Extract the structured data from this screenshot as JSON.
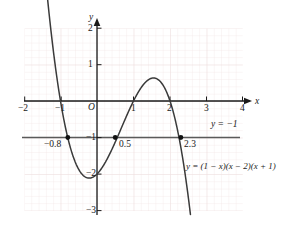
{
  "figure": {
    "title": "",
    "background_color": "#ffffff",
    "curve_color": "#333333",
    "axis_color": "#1a1a1a",
    "grid_color": "#f2e6e6",
    "point_color": "#000000"
  },
  "axes": {
    "x_axis_name": "x",
    "y_axis_name": "y",
    "origin_label": "O",
    "x_ticks": [
      "−2",
      "−1",
      "1",
      "2",
      "3",
      "4"
    ],
    "y_ticks": [
      "2",
      "1",
      "−1",
      "−2",
      "−3"
    ]
  },
  "annotations": {
    "line_label": "y = −1",
    "curve_label": "y = (1 − x)(x − 2)(x + 1)",
    "root_left": "−0.8",
    "root_mid": "0.5",
    "root_right": "2.3"
  },
  "chart_data": {
    "type": "line",
    "title": "",
    "xlabel": "x",
    "ylabel": "y",
    "xlim": [
      -2.2,
      4.25
    ],
    "ylim": [
      -3.25,
      2.25
    ],
    "grid": true,
    "grid_step": 0.2,
    "xticks": [
      -2,
      -1,
      1,
      2,
      3,
      4
    ],
    "yticks": [
      2,
      1,
      -1,
      -2,
      -3
    ],
    "series": [
      {
        "name": "y = (1 - x)(x - 2)(x + 1)",
        "type": "cubic",
        "equation": "y = (1 - x)(x - 2)(x + 1)",
        "expanded": "y = -x^3 + 2x^2 + x - 2",
        "domain": [
          -1.56,
          2.56
        ],
        "roots": [
          -1,
          1,
          2
        ],
        "local_minimum": {
          "x": 0.215,
          "y": -2.11
        },
        "local_maximum": {
          "x": 1.549,
          "y": 0.631
        }
      },
      {
        "name": "y = -1",
        "type": "horizontal-line",
        "y": -1,
        "x_from": -2.05,
        "x_to": 3.9
      }
    ],
    "intersections": [
      {
        "x": -0.8,
        "y": -1,
        "label": "−0.8"
      },
      {
        "x": 0.5,
        "y": -1,
        "label": "0.5"
      },
      {
        "x": 2.3,
        "y": -1,
        "label": "2.3"
      }
    ]
  }
}
